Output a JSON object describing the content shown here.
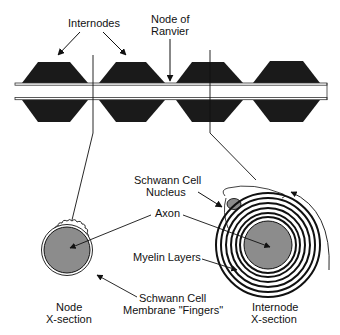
{
  "labels": {
    "internodes": "Internodes",
    "node_of_ranvier_line1": "Node of",
    "node_of_ranvier_line2": "Ranvier",
    "schwann_nucleus_line1": "Schwann Cell",
    "schwann_nucleus_line2": "Nucleus",
    "axon": "Axon",
    "myelin_layers": "Myelin Layers",
    "schwann_membrane_line1": "Schwann Cell",
    "schwann_membrane_line2": "Membrane \"Fingers\"",
    "node_xsection_line1": "Node",
    "node_xsection_line2": "X-section",
    "internode_xsection_line1": "Internode",
    "internode_xsection_line2": "X-section"
  },
  "colors": {
    "myelin": "#1a1a1a",
    "axon_fill": "#8c8c8c",
    "line": "#111111",
    "background": "#ffffff"
  }
}
